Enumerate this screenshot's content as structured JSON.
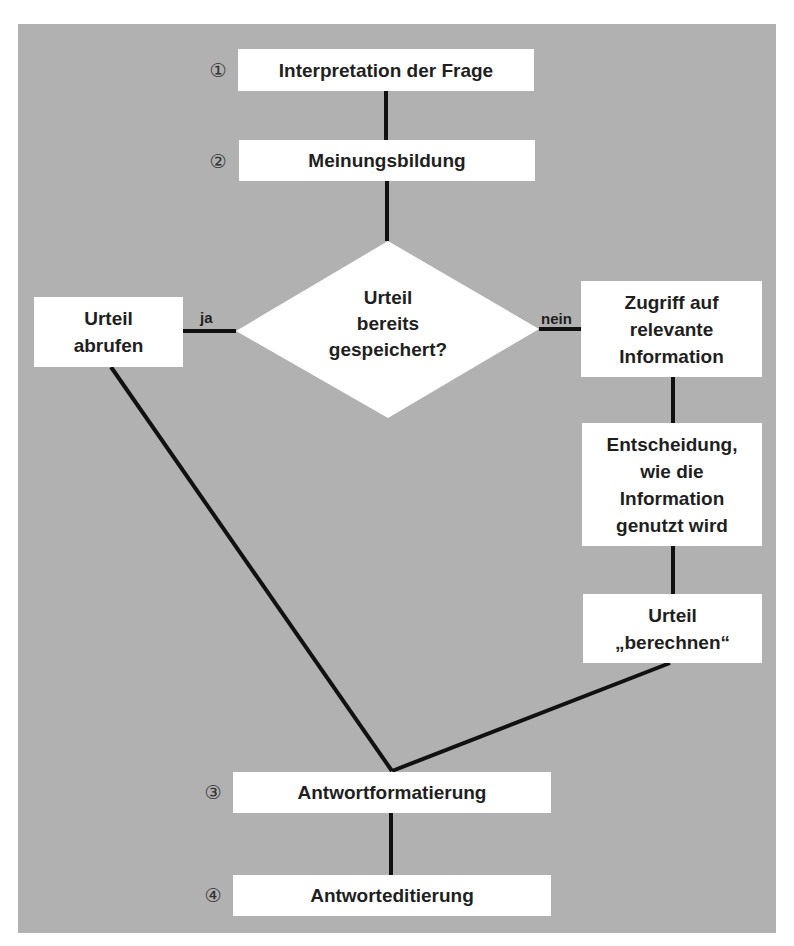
{
  "diagram": {
    "background_color": "#b1b1b1",
    "steps": [
      {
        "number": "①",
        "label": "Interpretation der Frage"
      },
      {
        "number": "②",
        "label": "Meinungsbildung"
      },
      {
        "number": "③",
        "label": "Antwortformatierung"
      },
      {
        "number": "④",
        "label": "Antworteditierung"
      }
    ],
    "decision": {
      "lines": [
        "Urteil",
        "bereits",
        "gespeichert?"
      ]
    },
    "branch_yes": {
      "label": "ja",
      "box": {
        "lines": [
          "Urteil",
          "abrufen"
        ]
      }
    },
    "branch_no": {
      "label": "nein",
      "boxes": [
        {
          "lines": [
            "Zugriff auf",
            "relevante",
            "Information"
          ]
        },
        {
          "lines": [
            "Entscheidung,",
            "wie die",
            "Information",
            "genutzt wird"
          ]
        },
        {
          "lines": [
            "Urteil",
            "„berechnen“"
          ]
        }
      ]
    }
  }
}
